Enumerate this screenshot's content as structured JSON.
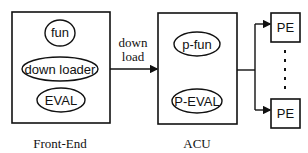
{
  "front_end": {
    "label": "Front-End",
    "items": [
      "fun",
      "down loader",
      "EVAL"
    ]
  },
  "arrow_label": {
    "line1": "down",
    "line2": "load"
  },
  "acu": {
    "label": "ACU",
    "items": [
      "p-fun",
      "P-EVAL"
    ]
  },
  "pe": {
    "top": "PE",
    "bottom": "PE"
  }
}
